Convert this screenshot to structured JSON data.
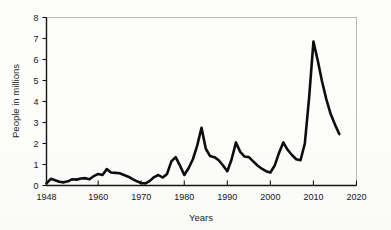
{
  "chart_data": {
    "type": "line",
    "title": "",
    "xlabel": "Years",
    "ylabel": "People in millions",
    "xlim": [
      1948,
      2020
    ],
    "ylim": [
      0,
      8
    ],
    "grid": false,
    "legend": null,
    "xticks": [
      1948,
      1960,
      1970,
      1980,
      1990,
      2000,
      2010,
      2020
    ],
    "xtick_labels": [
      "1948",
      "1960",
      "1970",
      "1980",
      "1990",
      "2000",
      "2010",
      "2020"
    ],
    "yticks": [
      0,
      1,
      2,
      3,
      4,
      5,
      6,
      7,
      8
    ],
    "ytick_labels": [
      "0",
      "1",
      "2",
      "3",
      "4",
      "5",
      "6",
      "7",
      "8"
    ],
    "line_color": "#0d0d0d",
    "series": [
      {
        "name": "People in millions",
        "x": [
          1948,
          1949,
          1950,
          1951,
          1952,
          1953,
          1954,
          1955,
          1956,
          1957,
          1958,
          1959,
          1960,
          1961,
          1962,
          1963,
          1964,
          1965,
          1966,
          1967,
          1968,
          1969,
          1970,
          1971,
          1972,
          1973,
          1974,
          1975,
          1976,
          1977,
          1978,
          1979,
          1980,
          1981,
          1982,
          1983,
          1984,
          1985,
          1986,
          1987,
          1988,
          1989,
          1990,
          1991,
          1992,
          1993,
          1994,
          1995,
          1996,
          1997,
          1998,
          1999,
          2000,
          2001,
          2002,
          2003,
          2004,
          2005,
          2006,
          2007,
          2008,
          2009,
          2010,
          2011,
          2012,
          2013,
          2014,
          2015,
          2016
        ],
        "values": [
          0.1,
          0.32,
          0.25,
          0.18,
          0.15,
          0.2,
          0.3,
          0.28,
          0.33,
          0.35,
          0.3,
          0.45,
          0.55,
          0.5,
          0.78,
          0.62,
          0.6,
          0.58,
          0.5,
          0.42,
          0.3,
          0.2,
          0.12,
          0.1,
          0.22,
          0.4,
          0.5,
          0.38,
          0.55,
          1.15,
          1.35,
          0.95,
          0.5,
          0.82,
          1.25,
          1.9,
          2.75,
          1.75,
          1.4,
          1.35,
          1.2,
          0.95,
          0.68,
          1.25,
          2.05,
          1.6,
          1.38,
          1.35,
          1.15,
          0.95,
          0.8,
          0.68,
          0.62,
          0.95,
          1.55,
          2.05,
          1.7,
          1.45,
          1.25,
          1.2,
          2.0,
          4.2,
          6.85,
          5.95,
          4.95,
          4.1,
          3.4,
          2.9,
          2.45
        ]
      }
    ]
  },
  "axis": {
    "y_title": "People in millions",
    "x_title": "Years"
  }
}
